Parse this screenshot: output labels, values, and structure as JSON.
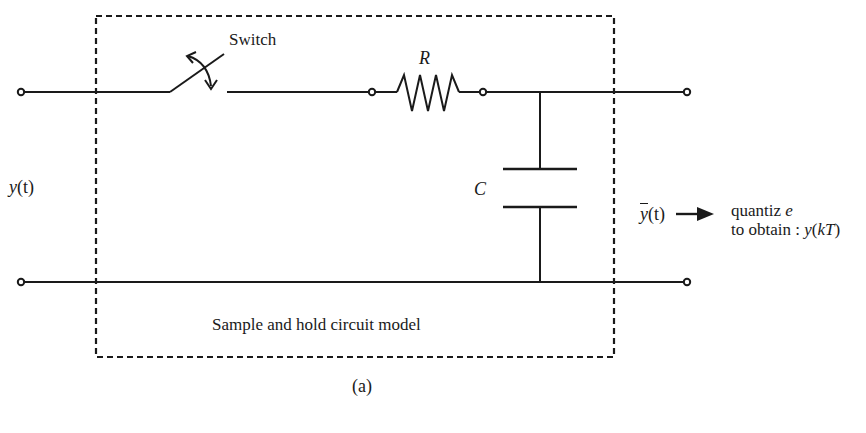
{
  "diagram": {
    "title": "Sample and hold circuit model",
    "caption": "(a)",
    "components": {
      "switch": {
        "label": "Switch"
      },
      "resistor": {
        "label": "R"
      },
      "capacitor": {
        "label": "C"
      }
    },
    "input": {
      "label_fn": "y",
      "label_arg": "(t)"
    },
    "output": {
      "label_fn": "y",
      "label_arg": "(t)",
      "note_line1": "quantiz",
      "note_line1_var": "e",
      "note_line2_prefix": "to obtain : ",
      "note_line2_fn": "y",
      "note_line2_arg_open": "(",
      "note_line2_arg": "kT",
      "note_line2_arg_close": ")"
    },
    "colors": {
      "stroke": "#1a1a1a",
      "background": "#ffffff"
    }
  }
}
